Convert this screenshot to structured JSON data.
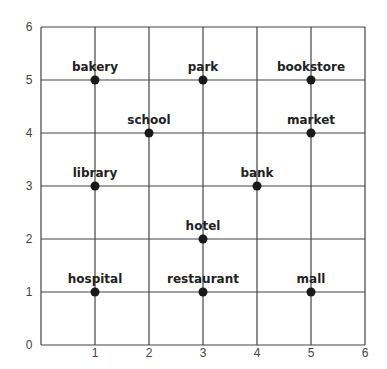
{
  "chart_data": {
    "type": "scatter",
    "title": "",
    "xlabel": "",
    "ylabel": "",
    "xlim": [
      0,
      6
    ],
    "ylim": [
      0,
      6
    ],
    "grid": true,
    "legend": null,
    "x_ticks": [
      "1",
      "2",
      "3",
      "4",
      "5",
      "6"
    ],
    "y_ticks": [
      "0",
      "1",
      "2",
      "3",
      "4",
      "5",
      "6"
    ],
    "points": [
      {
        "label": "bakery",
        "x": 1,
        "y": 5
      },
      {
        "label": "park",
        "x": 3,
        "y": 5
      },
      {
        "label": "bookstore",
        "x": 5,
        "y": 5
      },
      {
        "label": "school",
        "x": 2,
        "y": 4
      },
      {
        "label": "market",
        "x": 5,
        "y": 4
      },
      {
        "label": "library",
        "x": 1,
        "y": 3
      },
      {
        "label": "bank",
        "x": 4,
        "y": 3
      },
      {
        "label": "hotel",
        "x": 3,
        "y": 2
      },
      {
        "label": "hospital",
        "x": 1,
        "y": 1
      },
      {
        "label": "restaurant",
        "x": 3,
        "y": 1
      },
      {
        "label": "mall",
        "x": 5,
        "y": 1
      }
    ]
  },
  "style": {
    "grid_color": "#444444",
    "point_color": "#1a1a1a",
    "label_color": "#222222"
  }
}
